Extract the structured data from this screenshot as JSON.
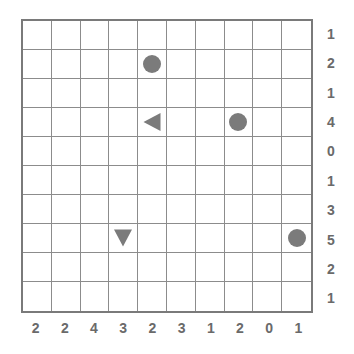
{
  "puzzle": {
    "rows": 10,
    "cols": 10,
    "row_clues": [
      "1",
      "2",
      "1",
      "4",
      "0",
      "1",
      "3",
      "5",
      "2",
      "1"
    ],
    "col_clues": [
      "2",
      "2",
      "4",
      "3",
      "2",
      "3",
      "1",
      "2",
      "0",
      "1"
    ],
    "pieces": [
      {
        "row": 1,
        "col": 4,
        "type": "circle"
      },
      {
        "row": 3,
        "col": 4,
        "type": "triangle-left"
      },
      {
        "row": 3,
        "col": 7,
        "type": "circle"
      },
      {
        "row": 7,
        "col": 3,
        "type": "triangle-down"
      },
      {
        "row": 7,
        "col": 9,
        "type": "circle"
      }
    ],
    "colors": {
      "grid": "#8c8c8c",
      "border": "#7a7a7a",
      "piece": "#7b7b7b",
      "clue": "#6a6a6a"
    }
  }
}
